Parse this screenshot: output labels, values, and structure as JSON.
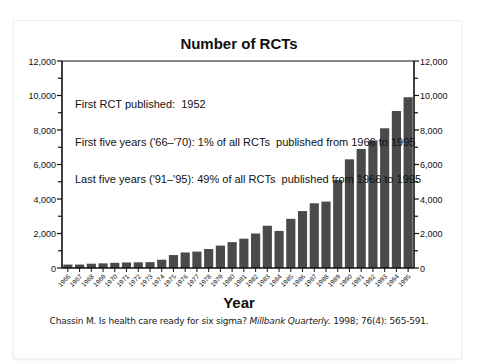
{
  "chart_data": {
    "type": "bar",
    "title": "Number of RCTs",
    "xlabel": "Year",
    "ylabel": "",
    "ylim": [
      0,
      12000
    ],
    "y_ticks": [
      "0",
      "2,000",
      "4,000",
      "6,000",
      "8,000",
      "10,000",
      "12,000"
    ],
    "y_axis_both_sides": true,
    "grid": false,
    "bar_color": "#4a4a4a",
    "categories": [
      "1966",
      "1967",
      "1968",
      "1969",
      "1970",
      "1971",
      "1972",
      "1973",
      "1974",
      "1975",
      "1976",
      "1977",
      "1978",
      "1979",
      "1980",
      "1981",
      "1982",
      "1983",
      "1984",
      "1985",
      "1986",
      "1987",
      "1988",
      "1989",
      "1990",
      "1991",
      "1992",
      "1993",
      "1994",
      "1995"
    ],
    "values": [
      200,
      200,
      250,
      270,
      300,
      320,
      330,
      340,
      480,
      750,
      900,
      950,
      1100,
      1300,
      1500,
      1700,
      2000,
      2450,
      2150,
      2850,
      3300,
      3750,
      3850,
      5100,
      6300,
      6900,
      7400,
      8100,
      9100,
      9900
    ],
    "annotations": [
      "First RCT published:  1952",
      "First five years ('66–'70): 1% of all RCTs  published from 1966 to 1995",
      "Last five years ('91–'95): 49% of all RCTs  published from 1966 to 1995"
    ]
  },
  "citation": {
    "prefix": "Chassin M. Is health care ready for six sigma? ",
    "journal": "Millbank Quarterly.",
    "suffix": " 1998; 76(4): 565-591."
  }
}
